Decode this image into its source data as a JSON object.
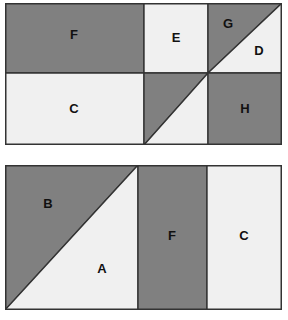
{
  "figure": {
    "background_color": "#ffffff",
    "colors": {
      "dark_fill": "#808080",
      "light_fill": "#f0f0f0",
      "outline": "#333333",
      "label_text": "#111111"
    },
    "diagrams": [
      {
        "id": "top",
        "name": "top-rectangle",
        "x": 5,
        "y": 3,
        "width": 277,
        "height": 142,
        "vertical_dividers": [
          139,
          203
        ],
        "horizontal_dividers": [
          70
        ],
        "regions": [
          {
            "label": "F",
            "shade": "dark",
            "shape": "rectangle",
            "points": "0,0 139,0 139,70 0,70",
            "label_x": 69,
            "label_y": 33
          },
          {
            "label": "E",
            "shade": "light",
            "shape": "rectangle",
            "points": "139,0 203,0 203,70 139,70",
            "label_x": 171,
            "label_y": 36
          },
          {
            "label": "G",
            "shade": "dark",
            "shape": "triangle",
            "points": "203,0 277,0 203,70",
            "label_x": 223,
            "label_y": 22
          },
          {
            "label": "D",
            "shade": "light",
            "shape": "triangle",
            "points": "277,0 277,70 203,70",
            "label_x": 254,
            "label_y": 49
          },
          {
            "label": "C",
            "shade": "light",
            "shape": "rectangle",
            "points": "0,70 139,70 139,142 0,142",
            "label_x": 69,
            "label_y": 107
          },
          {
            "label": "",
            "shade": "dark",
            "shape": "triangle",
            "points": "139,70 203,70 139,142",
            "label_x": 160,
            "label_y": 92
          },
          {
            "label": "",
            "shade": "light",
            "shape": "triangle",
            "points": "203,70 203,142 139,142",
            "label_x": 183,
            "label_y": 120
          },
          {
            "label": "H",
            "shade": "dark",
            "shape": "rectangle",
            "points": "203,70 277,70 277,142 203,142",
            "label_x": 240,
            "label_y": 107
          }
        ]
      },
      {
        "id": "bottom",
        "name": "bottom-rectangle",
        "x": 5,
        "y": 165,
        "width": 277,
        "height": 145,
        "vertical_dividers": [
          133,
          202
        ],
        "horizontal_dividers": [],
        "regions": [
          {
            "label": "B",
            "shade": "dark",
            "shape": "triangle",
            "points": "0,0 133,0 0,145",
            "label_x": 43,
            "label_y": 40
          },
          {
            "label": "A",
            "shade": "light",
            "shape": "triangle",
            "points": "133,0 133,145 0,145",
            "label_x": 97,
            "label_y": 105
          },
          {
            "label": "F",
            "shade": "dark",
            "shape": "rectangle",
            "points": "133,0 202,0 202,145 133,145",
            "label_x": 167,
            "label_y": 72
          },
          {
            "label": "C",
            "shade": "light",
            "shape": "rectangle",
            "points": "202,0 277,0 277,145 202,145",
            "label_x": 239,
            "label_y": 72
          }
        ]
      }
    ]
  }
}
